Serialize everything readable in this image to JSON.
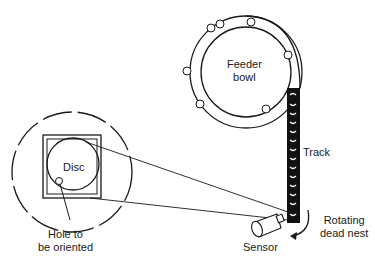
{
  "diagram": {
    "labels": {
      "feeder_bowl": [
        "Feeder",
        "bowl"
      ],
      "track": "Track",
      "disc": "Disc",
      "hole": [
        "Hole to",
        "be oriented"
      ],
      "sensor": "Sensor",
      "rotating_dead_nest": [
        "Rotating",
        "dead nest"
      ]
    },
    "colors": {
      "stroke": "#1a1a1a",
      "background": "#ffffff"
    }
  }
}
